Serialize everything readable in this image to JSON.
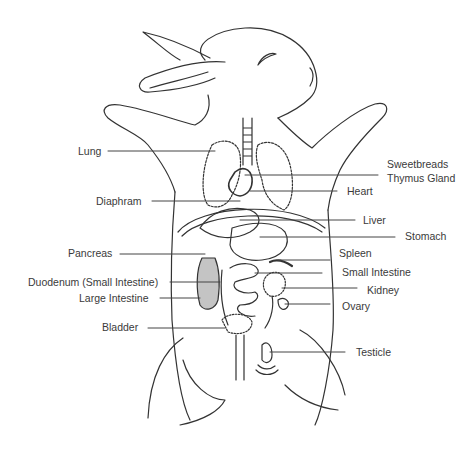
{
  "diagram": {
    "line_color": "#333333",
    "label_color": "#3a3a3a",
    "labels": [
      {
        "id": "lung",
        "text": "Lung",
        "x": 78,
        "y": 145
      },
      {
        "id": "diaphram",
        "text": "Diaphram",
        "x": 96,
        "y": 195
      },
      {
        "id": "pancreas",
        "text": "Pancreas",
        "x": 68,
        "y": 247
      },
      {
        "id": "duodenum",
        "text": "Duodenum (Small Intestine)",
        "x": 28,
        "y": 276
      },
      {
        "id": "large-intestine",
        "text": "Large Intestine",
        "x": 79,
        "y": 292
      },
      {
        "id": "bladder",
        "text": "Bladder",
        "x": 102,
        "y": 321
      },
      {
        "id": "sweetbreads",
        "text": "Sweetbreads",
        "x": 387,
        "y": 158
      },
      {
        "id": "thymus-gland",
        "text": "Thymus Gland",
        "x": 387,
        "y": 172
      },
      {
        "id": "heart",
        "text": "Heart",
        "x": 347,
        "y": 185
      },
      {
        "id": "liver",
        "text": "Liver",
        "x": 363,
        "y": 214
      },
      {
        "id": "stomach",
        "text": "Stomach",
        "x": 405,
        "y": 230
      },
      {
        "id": "spleen",
        "text": "Spleen",
        "x": 339,
        "y": 247
      },
      {
        "id": "small-intestine",
        "text": "Small Intestine",
        "x": 342,
        "y": 266
      },
      {
        "id": "kidney",
        "text": "Kidney",
        "x": 367,
        "y": 284
      },
      {
        "id": "ovary",
        "text": "Ovary",
        "x": 342,
        "y": 300
      },
      {
        "id": "testicle",
        "text": "Testicle",
        "x": 356,
        "y": 346
      }
    ]
  }
}
